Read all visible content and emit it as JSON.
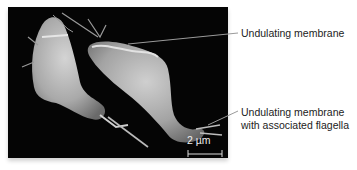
{
  "figure": {
    "image_description": "Scanning electron micrograph of two trichomonad protists on black background",
    "scale_bar": {
      "label": "2 µm"
    },
    "labels": [
      {
        "id": "undulating-membrane",
        "lines": [
          "Undulating membrane"
        ]
      },
      {
        "id": "undulating-membrane-flagella",
        "lines": [
          "Undulating membrane",
          "with associated flagella"
        ]
      }
    ],
    "colors": {
      "background": "#050505",
      "cell": "#bdbdbd",
      "text": "#222222",
      "leader": "#9a9a9a"
    }
  }
}
